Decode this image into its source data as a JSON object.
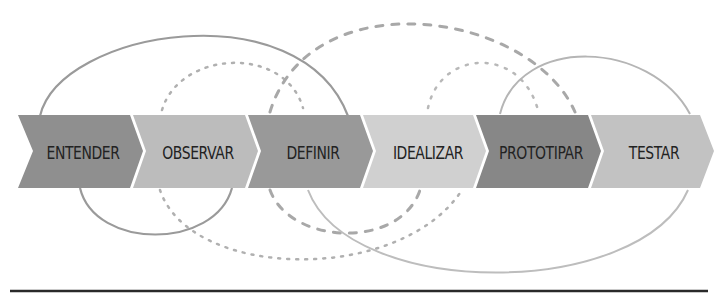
{
  "diagram": {
    "title": "",
    "steps": [
      {
        "label": "ENTENDER",
        "color": "#8f8f8f"
      },
      {
        "label": "OBSERVAR",
        "color": "#bcbcbc"
      },
      {
        "label": "DEFINIR",
        "color": "#999999"
      },
      {
        "label": "IDEALIZAR",
        "color": "#d0d0d0"
      },
      {
        "label": "PROTOTIPAR",
        "color": "#878787"
      },
      {
        "label": "TESTAR",
        "color": "#c2c2c2"
      }
    ],
    "loops": [
      {
        "name": "entender-definir-loop",
        "style": "solid",
        "color": "#9a9a9a"
      },
      {
        "name": "observar-idealizar-loop",
        "style": "dotted",
        "color": "#b0b0b0"
      },
      {
        "name": "definir-testar-loop",
        "style": "dashed",
        "color": "#a8a8a8"
      },
      {
        "name": "idealizar-prototipar-loop",
        "style": "dotted",
        "color": "#b8b8b8"
      },
      {
        "name": "prototipar-testar-loop",
        "style": "solid",
        "color": "#b5b5b5"
      }
    ],
    "baseline_color": "#2a2a2a"
  }
}
